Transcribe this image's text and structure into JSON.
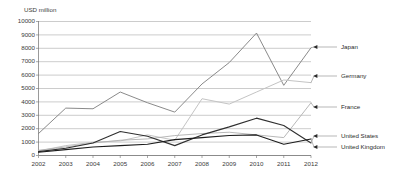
{
  "chart_data": {
    "type": "line",
    "title": "",
    "subtitle": "",
    "xlabel": "",
    "ylabel": "USD million",
    "ylim": [
      0,
      10000
    ],
    "grid": true,
    "legend_position": "right-inline-labels",
    "categories": [
      "2002",
      "2003",
      "2004",
      "2005",
      "2006",
      "2007",
      "2008",
      "2009",
      "2010",
      "2011",
      "2012"
    ],
    "y_ticks": [
      "0",
      "1000",
      "2000",
      "3000",
      "4000",
      "5000",
      "6000",
      "7000",
      "8000",
      "9000",
      "10000"
    ],
    "series": [
      {
        "name": "Japan",
        "color": "#7d7d7d",
        "width": 0.9,
        "values": [
          1600,
          3500,
          3450,
          4700,
          3900,
          3200,
          5300,
          6900,
          9100,
          5200,
          8000
        ]
      },
      {
        "name": "Germany",
        "color": "#c4c4c4",
        "width": 1.0,
        "values": [
          300,
          700,
          950,
          1050,
          1500,
          1100,
          4200,
          3800,
          4700,
          5600,
          5400
        ]
      },
      {
        "name": "France",
        "color": "#b0b0b0",
        "width": 0.9,
        "values": [
          350,
          600,
          900,
          1100,
          1200,
          1450,
          1600,
          1700,
          1500,
          1300,
          3900
        ]
      },
      {
        "name": "United States",
        "color": "#2f2f2f",
        "width": 1.1,
        "values": [
          250,
          500,
          900,
          1750,
          1400,
          700,
          1500,
          2100,
          2750,
          2200,
          900
        ]
      },
      {
        "name": "United Kingdom",
        "color": "#1d1d1d",
        "width": 1.1,
        "values": [
          200,
          400,
          600,
          700,
          800,
          1150,
          1300,
          1450,
          1500,
          800,
          1200
        ]
      }
    ]
  },
  "legend": {
    "items": [
      {
        "label": "Japan"
      },
      {
        "label": "Germany"
      },
      {
        "label": "France"
      },
      {
        "label": "United States"
      },
      {
        "label": "United Kingdom"
      }
    ]
  }
}
